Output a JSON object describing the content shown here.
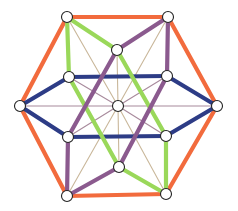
{
  "diagram": {
    "type": "graph",
    "colors": {
      "orange": "#f26b3d",
      "navy": "#2d3c86",
      "green": "#9ad85a",
      "purple": "#8b5a8e",
      "thin_tan": "#c9b79a",
      "thin_mauve": "#a88a9c",
      "node_fill": "#ffffff",
      "node_stroke": "#222222"
    },
    "nodes": [
      {
        "id": "TL",
        "x": 67,
        "y": 17
      },
      {
        "id": "TR",
        "x": 168,
        "y": 17
      },
      {
        "id": "R",
        "x": 217,
        "y": 106
      },
      {
        "id": "BR",
        "x": 166,
        "y": 194
      },
      {
        "id": "BL",
        "x": 67,
        "y": 196
      },
      {
        "id": "L",
        "x": 20,
        "y": 106
      },
      {
        "id": "UC",
        "x": 117,
        "y": 50
      },
      {
        "id": "LMU",
        "x": 69,
        "y": 77
      },
      {
        "id": "RMU",
        "x": 167,
        "y": 76
      },
      {
        "id": "LML",
        "x": 68,
        "y": 137
      },
      {
        "id": "RML",
        "x": 166,
        "y": 136
      },
      {
        "id": "LC",
        "x": 119,
        "y": 167
      },
      {
        "id": "C",
        "x": 118,
        "y": 106
      }
    ],
    "thin_edges": [
      {
        "from": "C",
        "to": "TL",
        "color": "thin_tan"
      },
      {
        "from": "C",
        "to": "TR",
        "color": "thin_tan"
      },
      {
        "from": "C",
        "to": "BL",
        "color": "thin_tan"
      },
      {
        "from": "C",
        "to": "BR",
        "color": "thin_tan"
      },
      {
        "from": "C",
        "to": "L",
        "color": "thin_mauve"
      },
      {
        "from": "C",
        "to": "R",
        "color": "thin_mauve"
      },
      {
        "from": "C",
        "to": "UC",
        "color": "thin_tan"
      },
      {
        "from": "C",
        "to": "LC",
        "color": "thin_tan"
      },
      {
        "from": "C",
        "to": "LMU",
        "color": "thin_mauve"
      },
      {
        "from": "C",
        "to": "RMU",
        "color": "thin_mauve"
      },
      {
        "from": "C",
        "to": "LML",
        "color": "thin_mauve"
      },
      {
        "from": "C",
        "to": "RML",
        "color": "thin_mauve"
      }
    ],
    "thick_edges": [
      {
        "from": "TL",
        "to": "TR",
        "color": "orange"
      },
      {
        "from": "TR",
        "to": "R",
        "color": "orange"
      },
      {
        "from": "R",
        "to": "BR",
        "color": "orange"
      },
      {
        "from": "BR",
        "to": "BL",
        "color": "orange"
      },
      {
        "from": "BL",
        "to": "L",
        "color": "orange"
      },
      {
        "from": "L",
        "to": "TL",
        "color": "orange"
      },
      {
        "from": "L",
        "to": "LMU",
        "color": "navy"
      },
      {
        "from": "LMU",
        "to": "RMU",
        "color": "navy"
      },
      {
        "from": "RMU",
        "to": "R",
        "color": "navy"
      },
      {
        "from": "L",
        "to": "LML",
        "color": "navy"
      },
      {
        "from": "LML",
        "to": "RML",
        "color": "navy"
      },
      {
        "from": "RML",
        "to": "R",
        "color": "navy"
      },
      {
        "from": "TL",
        "to": "LMU",
        "color": "green"
      },
      {
        "from": "TL",
        "to": "UC",
        "color": "green"
      },
      {
        "from": "UC",
        "to": "RML",
        "color": "green"
      },
      {
        "from": "RML",
        "to": "BR",
        "color": "green"
      },
      {
        "from": "LMU",
        "to": "LC",
        "color": "green"
      },
      {
        "from": "LC",
        "to": "BR",
        "color": "green"
      },
      {
        "from": "TR",
        "to": "RMU",
        "color": "purple"
      },
      {
        "from": "TR",
        "to": "UC",
        "color": "purple"
      },
      {
        "from": "UC",
        "to": "LML",
        "color": "purple"
      },
      {
        "from": "LML",
        "to": "BL",
        "color": "purple"
      },
      {
        "from": "BL",
        "to": "LC",
        "color": "purple"
      },
      {
        "from": "RMU",
        "to": "LC",
        "color": "purple"
      }
    ],
    "node_radius": 5.5,
    "thin_width": 1.1,
    "thick_width": 4.2
  }
}
